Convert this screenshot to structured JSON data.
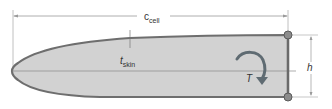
{
  "diagram": {
    "labels": {
      "chord_main": "c",
      "chord_sub": "cell",
      "skin_main": "t",
      "skin_sub": "skin",
      "height": "h",
      "torque": "T"
    },
    "colors": {
      "fill": "#d2d2d2",
      "outline": "#6e6e6e",
      "dimension_line": "#9a9a9a",
      "node": "#8c8c8c",
      "torque_arrow": "#5f6b72"
    }
  }
}
